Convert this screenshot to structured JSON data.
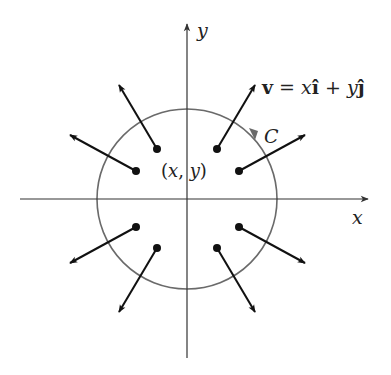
{
  "diagram": {
    "axes": {
      "x_label": "x",
      "y_label": "y",
      "origin": [
        187,
        199
      ],
      "x_axis": {
        "from": [
          20,
          199
        ],
        "to": [
          368,
          199
        ]
      },
      "y_axis": {
        "from": [
          187,
          358
        ],
        "to": [
          187,
          24
        ]
      }
    },
    "circle": {
      "label": "C",
      "center": [
        187,
        199
      ],
      "radius": 90,
      "orientation": "counterclockwise",
      "color": "#666666"
    },
    "point_label": "(x, y)",
    "field_label": {
      "v": "v",
      "eq": " = ",
      "x": "x",
      "i": "î",
      "plus": " + ",
      "y": "y",
      "j": "ĵ"
    },
    "vectors": [
      {
        "from": [
          157,
          149
        ],
        "to": [
          119,
          85
        ]
      },
      {
        "from": [
          136,
          171
        ],
        "to": [
          70,
          135
        ]
      },
      {
        "from": [
          217,
          149
        ],
        "to": [
          255,
          85
        ]
      },
      {
        "from": [
          239,
          171
        ],
        "to": [
          305,
          135
        ]
      },
      {
        "from": [
          136,
          227
        ],
        "to": [
          70,
          263
        ]
      },
      {
        "from": [
          157,
          248
        ],
        "to": [
          119,
          312
        ]
      },
      {
        "from": [
          239,
          227
        ],
        "to": [
          305,
          263
        ]
      },
      {
        "from": [
          217,
          248
        ],
        "to": [
          255,
          312
        ]
      }
    ],
    "colors": {
      "axis": "#333333",
      "arrow": "#111111",
      "circle": "#6a6a6a"
    }
  }
}
